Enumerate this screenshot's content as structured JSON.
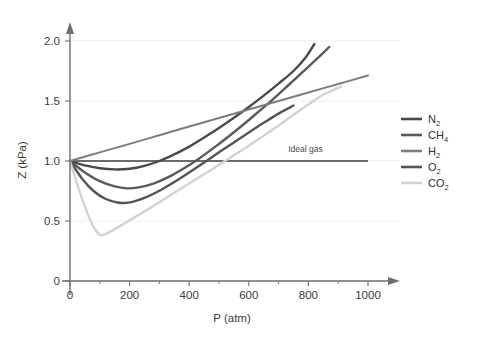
{
  "chart_data": {
    "type": "line",
    "title": "",
    "xlabel": "P (atm)",
    "ylabel": "Z (kPa)",
    "xlim": [
      0,
      1050
    ],
    "ylim": [
      0,
      2.12
    ],
    "xticks": [
      0,
      200,
      400,
      600,
      800,
      1000
    ],
    "xtick_labels": [
      "0",
      "200",
      "400",
      "600",
      "800",
      "1000"
    ],
    "xminor_ticks": [
      100,
      300,
      500,
      700,
      900
    ],
    "yticks": [
      0,
      0.5,
      1.0,
      1.5,
      2.0
    ],
    "ytick_labels": [
      "0",
      "0.5",
      "1.0",
      "1.5",
      "2.0"
    ],
    "grid": "horizontal-faint",
    "legend_position": "right",
    "annotations": [
      {
        "name": "ideal-gas-label",
        "text": "Ideal gas",
        "x": 790,
        "y": 1.04
      }
    ],
    "reference_line": {
      "name": "ideal-gas-line",
      "label": "Ideal gas",
      "y": 1.0,
      "x_start": 0,
      "x_end": 1000,
      "color": "#6b6b6b"
    },
    "series": [
      {
        "name": "N2",
        "label": "N",
        "sub": "2",
        "color": "#4a4a4a",
        "width": 2.4,
        "points": [
          [
            0,
            1.0
          ],
          [
            50,
            0.963
          ],
          [
            100,
            0.94
          ],
          [
            150,
            0.93
          ],
          [
            200,
            0.935
          ],
          [
            250,
            0.96
          ],
          [
            300,
            1.0
          ],
          [
            350,
            1.055
          ],
          [
            400,
            1.12
          ],
          [
            450,
            1.195
          ],
          [
            500,
            1.275
          ],
          [
            550,
            1.36
          ],
          [
            600,
            1.45
          ],
          [
            650,
            1.545
          ],
          [
            700,
            1.645
          ],
          [
            750,
            1.75
          ],
          [
            790,
            1.86
          ],
          [
            820,
            1.975
          ]
        ]
      },
      {
        "name": "CH4",
        "label": "CH",
        "sub": "4",
        "color": "#5a5a5a",
        "width": 2.4,
        "points": [
          [
            0,
            1.0
          ],
          [
            50,
            0.905
          ],
          [
            100,
            0.832
          ],
          [
            150,
            0.788
          ],
          [
            190,
            0.772
          ],
          [
            230,
            0.78
          ],
          [
            280,
            0.812
          ],
          [
            330,
            0.865
          ],
          [
            380,
            0.935
          ],
          [
            430,
            1.015
          ],
          [
            480,
            1.105
          ],
          [
            530,
            1.2
          ],
          [
            580,
            1.3
          ],
          [
            630,
            1.405
          ],
          [
            680,
            1.512
          ],
          [
            730,
            1.625
          ],
          [
            780,
            1.74
          ],
          [
            830,
            1.855
          ],
          [
            870,
            1.95
          ]
        ]
      },
      {
        "name": "H2",
        "label": "H",
        "sub": "2",
        "color": "#7d7d7d",
        "width": 2.0,
        "points": [
          [
            0,
            1.0
          ],
          [
            100,
            1.072
          ],
          [
            200,
            1.143
          ],
          [
            300,
            1.215
          ],
          [
            400,
            1.287
          ],
          [
            500,
            1.358
          ],
          [
            600,
            1.429
          ],
          [
            700,
            1.5
          ],
          [
            800,
            1.571
          ],
          [
            900,
            1.642
          ],
          [
            1000,
            1.712
          ]
        ]
      },
      {
        "name": "O2",
        "label": "O",
        "sub": "2",
        "color": "#555555",
        "width": 2.4,
        "points": [
          [
            0,
            1.0
          ],
          [
            40,
            0.855
          ],
          [
            80,
            0.748
          ],
          [
            120,
            0.683
          ],
          [
            160,
            0.654
          ],
          [
            180,
            0.65
          ],
          [
            210,
            0.66
          ],
          [
            250,
            0.692
          ],
          [
            300,
            0.752
          ],
          [
            350,
            0.825
          ],
          [
            400,
            0.905
          ],
          [
            450,
            0.988
          ],
          [
            500,
            1.072
          ],
          [
            550,
            1.155
          ],
          [
            600,
            1.238
          ],
          [
            650,
            1.318
          ],
          [
            700,
            1.395
          ],
          [
            750,
            1.462
          ]
        ]
      },
      {
        "name": "CO2",
        "label": "CO",
        "sub": "2",
        "color": "#d2d2d2",
        "width": 2.4,
        "points": [
          [
            0,
            1.0
          ],
          [
            25,
            0.8
          ],
          [
            50,
            0.62
          ],
          [
            75,
            0.47
          ],
          [
            100,
            0.385
          ],
          [
            120,
            0.392
          ],
          [
            150,
            0.432
          ],
          [
            200,
            0.505
          ],
          [
            250,
            0.58
          ],
          [
            300,
            0.657
          ],
          [
            350,
            0.735
          ],
          [
            400,
            0.812
          ],
          [
            450,
            0.89
          ],
          [
            500,
            0.968
          ],
          [
            550,
            1.048
          ],
          [
            600,
            1.128
          ],
          [
            650,
            1.21
          ],
          [
            700,
            1.295
          ],
          [
            750,
            1.385
          ],
          [
            800,
            1.47
          ],
          [
            850,
            1.552
          ],
          [
            910,
            1.62
          ]
        ]
      }
    ]
  },
  "legend": {
    "entries": [
      {
        "label": "N",
        "sub": "2",
        "color": "#4a4a4a"
      },
      {
        "label": "CH",
        "sub": "4",
        "color": "#5a5a5a"
      },
      {
        "label": "H",
        "sub": "2",
        "color": "#7d7d7d"
      },
      {
        "label": "O",
        "sub": "2",
        "color": "#555555"
      },
      {
        "label": "CO",
        "sub": "2",
        "color": "#d2d2d2"
      }
    ]
  },
  "colors": {
    "background": "#ffffff",
    "axis": "#6e6e6e",
    "grid": "#ededed",
    "text": "#3a3a3a"
  }
}
